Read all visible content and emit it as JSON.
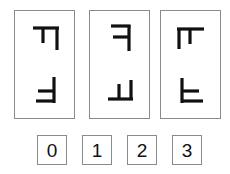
{
  "puzzle": {
    "cards": [
      {
        "top_glyph": "F rotated 90deg clockwise",
        "bottom_glyph": "F mirrored and rotated 180deg"
      },
      {
        "top_glyph": "F mirrored horizontally",
        "bottom_glyph": "F rotated 90deg counterclockwise"
      },
      {
        "top_glyph": "F rotated 90deg clockwise and mirrored",
        "bottom_glyph": "F flipped vertically"
      }
    ],
    "options": [
      {
        "label": "0"
      },
      {
        "label": "1"
      },
      {
        "label": "2"
      },
      {
        "label": "3"
      }
    ],
    "colors": {
      "border": "#8a8a8a",
      "glyph": "#111111",
      "background": "#ffffff"
    }
  }
}
